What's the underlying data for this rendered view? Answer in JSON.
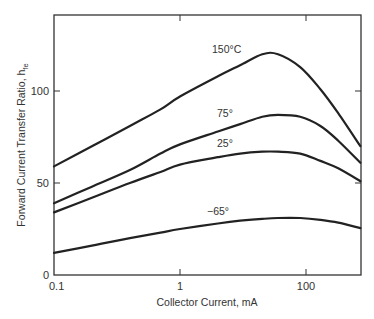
{
  "chart_data": {
    "type": "line",
    "title": "",
    "xlabel": "Collector Current, mA",
    "ylabel": "Forward Current Transfer Ratio, h",
    "ylabel_subscript": "fe",
    "xscale": "log",
    "x_ticks": [
      {
        "label": "0.1",
        "pos": 0.1
      },
      {
        "label": "1",
        "pos": 1
      },
      {
        "label": "100",
        "pos": 10
      }
    ],
    "y_ticks": [
      {
        "label": "0",
        "value": 0
      },
      {
        "label": "50",
        "value": 50
      },
      {
        "label": "100",
        "value": 100
      }
    ],
    "xlim": [
      0.1,
      27
    ],
    "ylim": [
      0,
      141
    ],
    "grid": false,
    "legend": "inline-labels",
    "series": [
      {
        "name": "150°C",
        "label": "150°C",
        "label_pos": [
          212,
          53
        ],
        "x": [
          0.1,
          0.2,
          0.4,
          0.7,
          1,
          2,
          3,
          4.5,
          6,
          9,
          13,
          18,
          27
        ],
        "values": [
          59,
          70,
          81,
          90,
          97,
          108,
          114,
          120,
          120,
          113,
          101,
          88,
          70
        ]
      },
      {
        "name": "75°",
        "label": "75°",
        "label_pos": [
          217,
          117
        ],
        "x": [
          0.1,
          0.2,
          0.4,
          0.7,
          1,
          2,
          3,
          4.5,
          6,
          9,
          13,
          18,
          27
        ],
        "values": [
          39,
          48,
          57,
          66,
          71,
          78,
          82,
          86,
          87,
          86,
          81,
          73,
          61
        ]
      },
      {
        "name": "25°",
        "label": "25°",
        "label_pos": [
          217,
          147
        ],
        "x": [
          0.1,
          0.2,
          0.4,
          0.7,
          1,
          2,
          3,
          4.5,
          6,
          9,
          13,
          18,
          27
        ],
        "values": [
          34,
          42,
          50,
          56,
          60,
          64,
          66,
          67,
          67,
          66,
          62,
          58,
          51
        ]
      },
      {
        "name": "-65°",
        "label": "−65°",
        "label_pos": [
          207,
          215
        ],
        "x": [
          0.1,
          0.2,
          0.4,
          0.7,
          1,
          2,
          3,
          4.5,
          6,
          9,
          13,
          18,
          27
        ],
        "values": [
          12,
          16,
          20,
          23,
          25,
          28,
          29.5,
          30.5,
          31,
          31,
          30,
          28.5,
          25.5
        ]
      }
    ]
  },
  "axes": {
    "x_title": "Collector Current, mA",
    "y_title_main": "Forward Current Transfer Ratio, h",
    "y_title_sub": "fe"
  }
}
